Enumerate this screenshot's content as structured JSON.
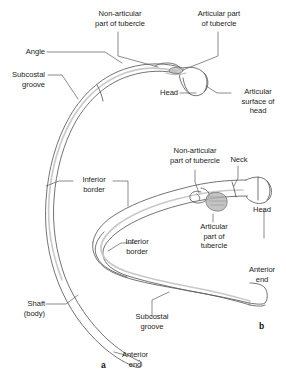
{
  "figure": {
    "title_implicit": "",
    "background_color": "#ffffff",
    "line_color": "#5a5a5a",
    "shade_color": "#c9c9c9",
    "panels": [
      {
        "id": "a",
        "letter": "a",
        "description": "superior view of a typical rib"
      },
      {
        "id": "b",
        "letter": "b",
        "description": "posterior-inferior view of a typical rib"
      }
    ]
  },
  "labels": {
    "non_articular_tubercle_top": "Non-articular\npart of tubercle",
    "articular_tubercle_top": "Articular part\nof tubercle",
    "angle": "Angle",
    "subcostal_groove_left": "Subcostal\ngroove",
    "head_top": "Head",
    "articular_surface_of_head": "Articular\nsurface of\nhead",
    "non_articular_tubercle_mid": "Non-articular\npart of tubercle",
    "neck": "Neck",
    "head_right": "Head",
    "inferior_border_1": "Inferior\nborder",
    "inferior_border_2": "Inferior\nborder",
    "articular_part_of_tubercle_mid": "Articular\npart of\ntubercle",
    "anterior_end_right": "Anterior\nend",
    "shaft_body": "Shaft\n(body)",
    "subcostal_groove_bottom": "Subcostal\ngroove",
    "anterior_end_bottom": "Anterior\nend",
    "panel_a_letter": "a",
    "panel_b_letter": "b"
  }
}
